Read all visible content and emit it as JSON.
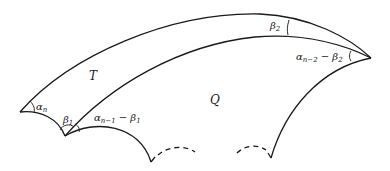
{
  "diagram": {
    "title": "",
    "regions": {
      "T": "T",
      "Q": "Q"
    },
    "angles": {
      "alpha_n": {
        "base": "α",
        "sub": "n"
      },
      "beta_1": {
        "base": "β",
        "sub": "1"
      },
      "alpha_n1_minus_beta1": {
        "base": "α",
        "sub": "n−1",
        "rest": " − β",
        "rest_sub": "1"
      },
      "beta_2": {
        "base": "β",
        "sub": "2"
      },
      "alpha_n2_minus_beta2": {
        "base": "α",
        "sub": "n−2",
        "rest": " − β",
        "rest_sub": "2"
      }
    },
    "colors": {
      "stroke": "#1a1a1a",
      "background": "#ffffff"
    }
  }
}
